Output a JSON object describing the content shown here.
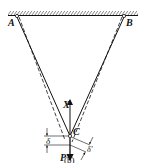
{
  "diagram": {
    "caption": "(b)",
    "support_labels": {
      "left": "A",
      "right": "B"
    },
    "joint_label": "C",
    "force_up_label": "X",
    "force_down_label": "P",
    "displacement_vertical_label": "δ",
    "displacement_inclined_label": "δ'",
    "colors": {
      "line": "#111111",
      "background": "#ffffff"
    }
  }
}
